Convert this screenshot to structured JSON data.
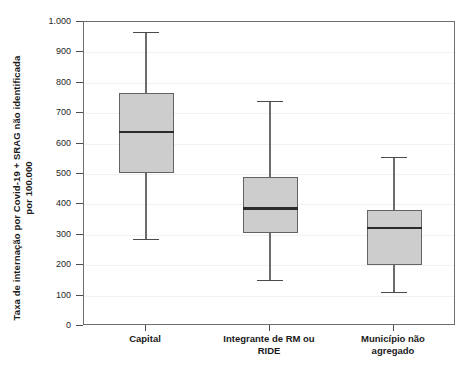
{
  "chart_data": {
    "type": "box",
    "title": "",
    "xlabel": "",
    "ylabel_line1": "Taxa de internação por Covid-19 + SRAG não identificada",
    "ylabel_line2": "por 100.000",
    "categories": [
      "Capital",
      "Integrante de RM ou RIDE",
      "Município não agregado"
    ],
    "category_labels_multiline": [
      [
        "Capital"
      ],
      [
        "Integrante de RM ou",
        "RIDE"
      ],
      [
        "Município não",
        "agregado"
      ]
    ],
    "ylim": [
      0,
      1000
    ],
    "ytick_values": [
      0,
      100,
      200,
      300,
      400,
      500,
      600,
      700,
      800,
      900,
      1000
    ],
    "ytick_labels": [
      "0",
      "100",
      "200",
      "300",
      "400",
      "500",
      "600",
      "700",
      "800",
      "900",
      "1.000"
    ],
    "grid": true,
    "legend": "none",
    "boxes": [
      {
        "category": "Capital",
        "whisker_low": 287,
        "q1": 503,
        "median": 638,
        "q3": 765,
        "whisker_high": 968
      },
      {
        "category": "Integrante de RM ou RIDE",
        "whisker_low": 152,
        "q1": 305,
        "median": 387,
        "q3": 490,
        "whisker_high": 740
      },
      {
        "category": "Município não agregado",
        "whisker_low": 112,
        "q1": 200,
        "median": 322,
        "q3": 383,
        "whisker_high": 556
      }
    ],
    "colors": {
      "box_fill": "#cdcdcd",
      "box_edge": "#636363",
      "median": "#2b2b2b",
      "whisker": "#6b6b6b",
      "frame": "#6e6e6e",
      "grid": "#f2f2f2",
      "text": "#1a1a1a",
      "background": "#ffffff"
    }
  }
}
